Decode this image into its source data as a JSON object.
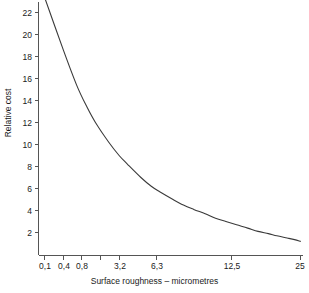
{
  "chart_data": {
    "type": "line",
    "title": "",
    "xlabel": "Surface roughness – micrometres",
    "ylabel": "Relative cost",
    "grid": false,
    "legend": null,
    "x_scale": "log-like (doubling tick sequence)",
    "x_tick_labels": [
      "0,1",
      "0,4",
      "0,8",
      "3,2",
      "6,3",
      "12,5",
      "25"
    ],
    "x_tick_values": [
      0.1,
      0.4,
      0.8,
      3.2,
      6.3,
      12.5,
      25
    ],
    "x_unlabeled_ticks": [
      1.6,
      18.75
    ],
    "xlim": [
      0.1,
      25
    ],
    "y_tick_labels": [
      "2",
      "4",
      "6",
      "8",
      "10",
      "12",
      "14",
      "16",
      "18",
      "20",
      "22"
    ],
    "y_tick_values": [
      2,
      4,
      6,
      8,
      10,
      12,
      14,
      16,
      18,
      20,
      22
    ],
    "ylim": [
      0,
      23.4
    ],
    "series": [
      {
        "name": "Relative cost",
        "x": [
          0.1,
          0.15,
          0.2,
          0.25,
          0.3,
          0.4,
          0.5,
          0.6,
          0.8,
          1.0,
          1.2,
          1.6,
          2.0,
          2.5,
          3.2,
          4.0,
          5.0,
          6.3,
          8.0,
          10.0,
          12.5,
          15.0,
          18.75,
          22.0,
          25.0
        ],
        "y": [
          23.4,
          18.6,
          15.4,
          13.4,
          12.0,
          10.2,
          9.0,
          8.2,
          7.0,
          6.2,
          5.7,
          5.0,
          4.5,
          4.1,
          3.7,
          3.3,
          3.0,
          2.7,
          2.4,
          2.1,
          1.9,
          1.7,
          1.5,
          1.35,
          1.2
        ]
      }
    ],
    "colors": {
      "curve": "#3a3a3a",
      "axis": "#555555",
      "background": "#ffffff",
      "text": "#1a1a1a"
    }
  },
  "axes": {
    "y_title": "Relative cost",
    "x_title": "Surface roughness – micrometres",
    "y_ticks": [
      {
        "label": "22"
      },
      {
        "label": "20"
      },
      {
        "label": "18"
      },
      {
        "label": "16"
      },
      {
        "label": "14"
      },
      {
        "label": "12"
      },
      {
        "label": "10"
      },
      {
        "label": "8"
      },
      {
        "label": "6"
      },
      {
        "label": "4"
      },
      {
        "label": "2"
      }
    ],
    "x_ticks": [
      {
        "label": "0,1"
      },
      {
        "label": "0,4"
      },
      {
        "label": "0,8"
      },
      {
        "label": "3,2"
      },
      {
        "label": "6,3"
      },
      {
        "label": "12,5"
      },
      {
        "label": "25"
      }
    ]
  }
}
